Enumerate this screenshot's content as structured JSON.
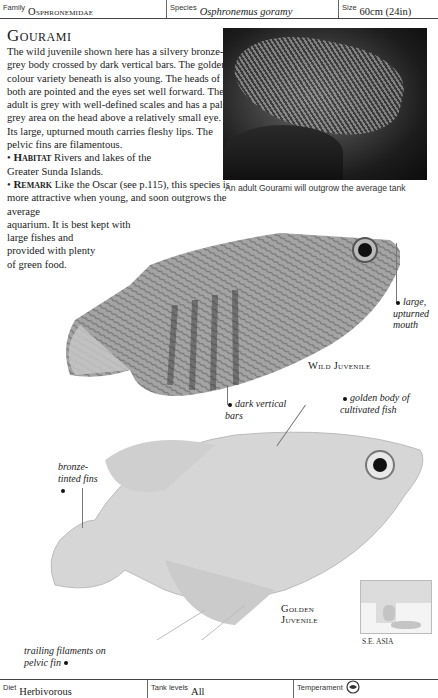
{
  "header": {
    "family_label": "Family",
    "family_value": "Osphronemidae",
    "species_label": "Species",
    "species_value": "Osphronemus goramy",
    "size_label": "Size",
    "size_value": "60cm (24in)"
  },
  "title": "Gourami",
  "body": {
    "intro": "The wild juvenile shown here has a silvery bronze-grey body crossed by dark vertical bars. The golden colour variety beneath is also young. The heads of both are pointed and the eyes set well forward. The adult is grey with well-defined scales and has a pale grey area on the head above a relatively small eye. Its large, upturned mouth carries fleshy lips. The pelvic fins are filamentous.",
    "habitat_label": "Habitat",
    "habitat_text": "Rivers and lakes of the Greater Sunda Islands.",
    "remark_label": "Remark",
    "remark_text_1": "Like the Oscar (see p.115), this species is more attractive when young, and soon outgrows the average",
    "remark_text_2": "aquarium. It is best kept with",
    "remark_text_3": "large fishes and provided with plenty of green food.",
    "bullet": "•"
  },
  "photo": {
    "caption": "An adult Gourami will outgrow the average tank"
  },
  "annotations": {
    "mouth": "large, upturned mouth",
    "bars": "dark vertical bars",
    "golden_body": "golden body of cultivated fish",
    "fins": "bronze-tinted fins",
    "filaments": "trailing filaments on pelvic fin"
  },
  "labels": {
    "wild": "Wild Juvenile",
    "golden_line1": "Golden",
    "golden_line2": "Juvenile"
  },
  "map": {
    "label": "S.E. ASIA"
  },
  "footer": {
    "diet_label": "Diet",
    "diet_value": "Herbivorous",
    "tank_label": "Tank levels",
    "tank_value": "All",
    "temperament_label": "Temperament",
    "temperament_icon": "fish-peaceful-icon"
  }
}
